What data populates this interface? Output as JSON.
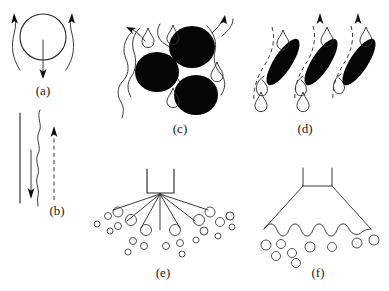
{
  "figure": {
    "background_color": "#ffffff",
    "ink_color": "#0d0d0d",
    "width": 389,
    "height": 291
  },
  "panels": [
    {
      "id": "a",
      "label": "(a)",
      "label_x": 43,
      "label_y": 95,
      "name": "bag-breakup-single-drop",
      "description": "Circular drop with two curved aerodynamic streamlines flowing upward on either side and a straight arrow pointing downward through the centre."
    },
    {
      "id": "b",
      "label": "(b)",
      "label_x": 57,
      "label_y": 215,
      "name": "shear-layer-wavy-jet",
      "description": "Vertical straight line, a wavy jet line, a solid downward arrow and a dashed upward arrow."
    },
    {
      "id": "c",
      "label": "(c)",
      "label_x": 180,
      "label_y": 133,
      "name": "drop-cluster-breakup",
      "description": "Three solid black round drops surrounded by curved streamlines, outlined teardrops and two curved arrows."
    },
    {
      "id": "d",
      "label": "(d)",
      "label_x": 305,
      "label_y": 133,
      "name": "ligament-stripping",
      "description": "Three tilted solid black ligaments with dashed streamlines, outlined teardrops above and below, and two straight upward arrows."
    },
    {
      "id": "e",
      "label": "(e)",
      "label_x": 163,
      "label_y": 277,
      "name": "hollow-cone-spray-nozzle",
      "description": "Rectangular nozzle with straight radiating spray lines and scattered open circular droplets."
    },
    {
      "id": "f",
      "label": "(f)",
      "label_x": 318,
      "label_y": 277,
      "name": "liquid-sheet-nozzle",
      "description": "Nozzle producing a conical liquid sheet terminating in a wavy breakup edge with open circular droplets beneath."
    }
  ],
  "panel_a": {
    "drop": {
      "cx": 43,
      "cy": 37,
      "r": 23
    },
    "center_arrow": {
      "x": 43,
      "y_start": 40,
      "y_end": 77,
      "direction": "down"
    },
    "streamlines": [
      {
        "side": "left",
        "arrow_direction": "up"
      },
      {
        "side": "right",
        "arrow_direction": "up"
      }
    ]
  },
  "panel_b": {
    "straight_line": {
      "x": 20,
      "y_top": 113,
      "y_bottom": 203
    },
    "wavy_line": {
      "x": 39,
      "y_top": 110,
      "y_bottom": 205
    },
    "solid_arrow": {
      "x": 31,
      "y_start": 150,
      "y_end": 197,
      "direction": "down"
    },
    "dashed_arrow": {
      "x": 54,
      "y_start": 200,
      "y_end": 128,
      "direction": "up"
    }
  },
  "panel_c": {
    "blobs": [
      {
        "cx": 192,
        "cy": 47,
        "rx": 23,
        "ry": 21,
        "rotation": 0
      },
      {
        "cx": 157,
        "cy": 72,
        "rx": 22,
        "ry": 20,
        "rotation": 0
      },
      {
        "cx": 196,
        "cy": 95,
        "rx": 22,
        "ry": 20,
        "rotation": 0
      }
    ],
    "droplets": [
      {
        "x": 148,
        "y": 30
      },
      {
        "x": 172,
        "y": 27
      },
      {
        "x": 216,
        "y": 67
      },
      {
        "x": 172,
        "y": 96
      }
    ],
    "arrows": [
      {
        "position": "top-left",
        "direction": "up-left"
      },
      {
        "position": "top-right",
        "direction": "up-right"
      }
    ]
  },
  "panel_d": {
    "ligaments": [
      {
        "cx": 283,
        "cy": 62,
        "rx": 27,
        "ry": 9,
        "rotation": -57
      },
      {
        "cx": 320,
        "cy": 62,
        "rx": 27,
        "ry": 9,
        "rotation": -57
      },
      {
        "cx": 358,
        "cy": 62,
        "rx": 27,
        "ry": 9,
        "rotation": -57
      }
    ],
    "droplets_above": [
      {
        "x": 283,
        "y": 33
      },
      {
        "x": 326,
        "y": 30
      },
      {
        "x": 365,
        "y": 30
      }
    ],
    "droplets_below": [
      {
        "x": 261,
        "y": 99
      },
      {
        "x": 303,
        "y": 99
      },
      {
        "x": 341,
        "y": 95
      }
    ],
    "dashed_streamline_count": 3,
    "arrows": [
      {
        "x": 320,
        "direction": "up"
      },
      {
        "x": 358,
        "direction": "up"
      }
    ]
  },
  "panel_e": {
    "nozzle": {
      "x": 147,
      "y": 169,
      "width": 27,
      "height": 24
    },
    "spray_line_count": 7,
    "droplet_count": 22,
    "droplet_style": "open-circle"
  },
  "panel_f": {
    "nozzle": {
      "x": 303,
      "y": 168,
      "width": 29,
      "height": 18
    },
    "sheet": {
      "spread_half_width": 57,
      "edge": "wavy"
    },
    "droplet_count": 9,
    "droplet_style": "open-circle"
  }
}
